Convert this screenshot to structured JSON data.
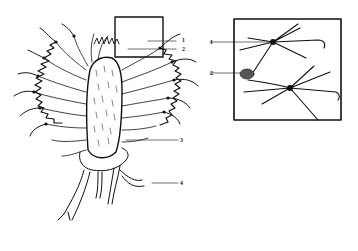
{
  "figure": {
    "main_labels": [
      {
        "id": "1",
        "text": "1"
      },
      {
        "id": "2",
        "text": "2"
      },
      {
        "id": "3",
        "text": "3"
      },
      {
        "id": "4",
        "text": "4"
      }
    ],
    "inset_labels": [
      {
        "id": "1",
        "text": "1"
      },
      {
        "id": "2",
        "text": "2"
      }
    ],
    "colors": {
      "ink": "#111111",
      "background": "#ffffff"
    }
  }
}
